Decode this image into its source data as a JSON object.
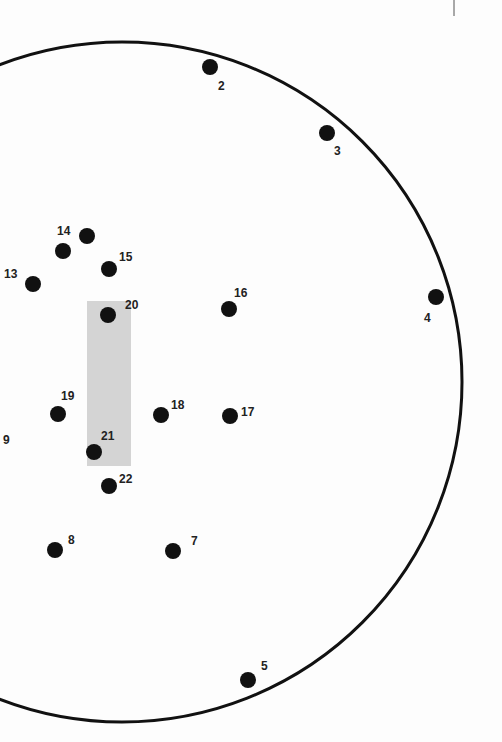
{
  "worksheet": {
    "type": "connect-the-dots",
    "outline": {
      "shape": "circle",
      "cx": 122,
      "cy": 382,
      "r": 340,
      "stroke": "#111111",
      "stroke_width": 3
    },
    "highlight_rect": {
      "x": 87,
      "y": 301,
      "width": 44,
      "height": 165,
      "fill": "#d4d4d4"
    },
    "top_right_divider": {
      "x": 454,
      "y1": 0,
      "y2": 16
    },
    "dot_color": "#111111",
    "dot_radius": 8,
    "dots": [
      {
        "label": "2",
        "x": 210,
        "y": 67,
        "lx": 218,
        "ly": 90,
        "anchor": "start"
      },
      {
        "label": "3",
        "x": 327,
        "y": 133,
        "lx": 334,
        "ly": 155,
        "anchor": "start"
      },
      {
        "label": "4",
        "x": 436,
        "y": 297,
        "lx": 424,
        "ly": 322,
        "anchor": "start"
      },
      {
        "label": "5",
        "x": 248,
        "y": 680,
        "lx": 261,
        "ly": 670,
        "anchor": "start"
      },
      {
        "label": "7",
        "x": 173,
        "y": 551,
        "lx": 191,
        "ly": 545,
        "anchor": "start"
      },
      {
        "label": "8",
        "x": 55,
        "y": 550,
        "lx": 68,
        "ly": 544,
        "anchor": "start"
      },
      {
        "label": "9",
        "x": -20,
        "y": -20,
        "lx": 3,
        "ly": 444,
        "anchor": "start"
      },
      {
        "label": "13",
        "x": 33,
        "y": 284,
        "lx": 4,
        "ly": 278,
        "anchor": "start"
      },
      {
        "label": "14",
        "x": 87,
        "y": 236,
        "lx": 57,
        "ly": 235,
        "anchor": "start"
      },
      {
        "label": "",
        "x": 63,
        "y": 251,
        "lx": 0,
        "ly": 0,
        "anchor": "start"
      },
      {
        "label": "15",
        "x": 109,
        "y": 269,
        "lx": 119,
        "ly": 261,
        "anchor": "start"
      },
      {
        "label": "16",
        "x": 229,
        "y": 309,
        "lx": 234,
        "ly": 297,
        "anchor": "start"
      },
      {
        "label": "17",
        "x": 230,
        "y": 416,
        "lx": 241,
        "ly": 416,
        "anchor": "start"
      },
      {
        "label": "18",
        "x": 161,
        "y": 415,
        "lx": 171,
        "ly": 409,
        "anchor": "start"
      },
      {
        "label": "19",
        "x": 58,
        "y": 414,
        "lx": 61,
        "ly": 400,
        "anchor": "start"
      },
      {
        "label": "20",
        "x": 108,
        "y": 315,
        "lx": 125,
        "ly": 309,
        "anchor": "start"
      },
      {
        "label": "21",
        "x": 94,
        "y": 452,
        "lx": 101,
        "ly": 440,
        "anchor": "start"
      },
      {
        "label": "22",
        "x": 109,
        "y": 486,
        "lx": 119,
        "ly": 483,
        "anchor": "start"
      }
    ]
  }
}
